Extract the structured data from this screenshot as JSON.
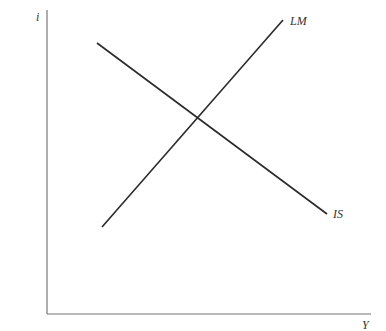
{
  "diagram": {
    "axes": {
      "y_label": "i",
      "x_label": "Y"
    },
    "curves": [
      {
        "name": "IS",
        "label": "IS",
        "x1": 97,
        "y1": 43,
        "x2": 327,
        "y2": 214
      },
      {
        "name": "LM",
        "label": "LM",
        "x1": 102,
        "y1": 227,
        "x2": 283,
        "y2": 20
      }
    ],
    "colors": {
      "axis": "#777777",
      "curve": "#2a2a2a",
      "label": "#333333"
    }
  }
}
